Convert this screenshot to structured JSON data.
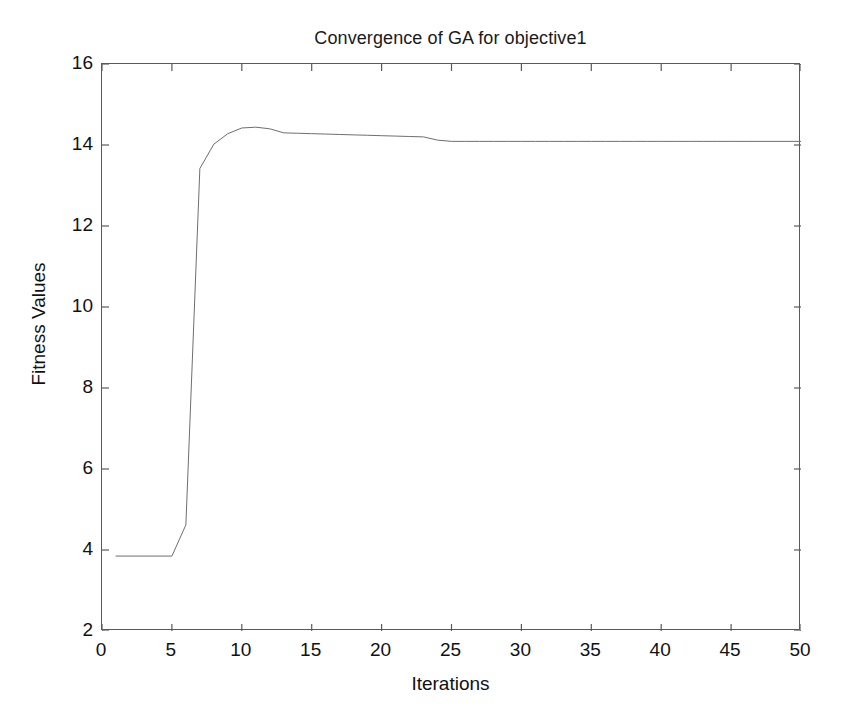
{
  "chart_data": {
    "type": "line",
    "title": "Convergence of GA for objective1",
    "xlabel": "Iterations",
    "ylabel": "Fitness Values",
    "xlim": [
      0,
      50
    ],
    "ylim": [
      2,
      16
    ],
    "grid": false,
    "legend": null,
    "xticks": [
      0,
      5,
      10,
      15,
      20,
      25,
      30,
      35,
      40,
      45,
      50
    ],
    "yticks": [
      2,
      4,
      6,
      8,
      10,
      12,
      14,
      16
    ],
    "xtick_labels": [
      "0",
      "5",
      "10",
      "15",
      "20",
      "25",
      "30",
      "35",
      "40",
      "45",
      "50"
    ],
    "ytick_labels": [
      "2",
      "4",
      "6",
      "8",
      "10",
      "12",
      "14",
      "16"
    ],
    "series": [
      {
        "name": "Best fitness",
        "color": "#6e6e6e",
        "line_width": 1,
        "x": [
          1,
          2,
          3,
          4,
          5,
          6,
          7,
          8,
          9,
          10,
          11,
          12,
          13,
          14,
          15,
          16,
          17,
          18,
          19,
          20,
          21,
          22,
          23,
          24,
          25,
          26,
          27,
          28,
          29,
          30,
          31,
          32,
          33,
          34,
          35,
          36,
          37,
          38,
          39,
          40,
          41,
          42,
          43,
          44,
          45,
          46,
          47,
          48,
          49,
          50
        ],
        "y": [
          3.85,
          3.85,
          3.85,
          3.85,
          3.85,
          4.62,
          13.42,
          14.02,
          14.28,
          14.42,
          14.44,
          14.4,
          14.3,
          14.29,
          14.28,
          14.27,
          14.26,
          14.25,
          14.24,
          14.23,
          14.22,
          14.21,
          14.2,
          14.12,
          14.09,
          14.09,
          14.09,
          14.09,
          14.09,
          14.09,
          14.09,
          14.09,
          14.09,
          14.09,
          14.09,
          14.09,
          14.09,
          14.09,
          14.09,
          14.09,
          14.09,
          14.09,
          14.09,
          14.09,
          14.09,
          14.09,
          14.09,
          14.09,
          14.09,
          14.09
        ]
      }
    ],
    "annotations": []
  }
}
